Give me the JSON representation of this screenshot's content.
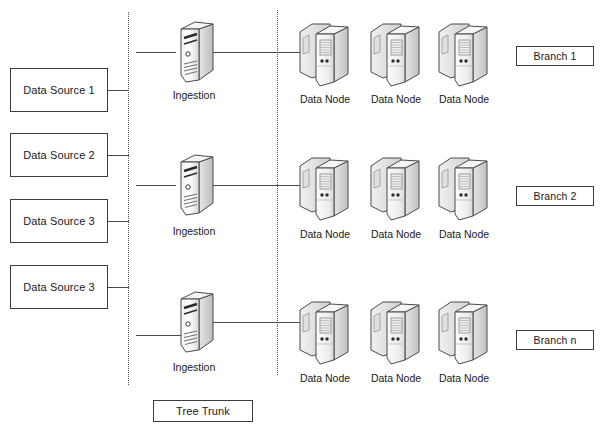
{
  "diagram": {
    "background_color": "#ffffff",
    "line_color": "#4a4a4a",
    "border_color": "#3c3c3c",
    "text_color": "#1a1a1a"
  },
  "data_sources": [
    {
      "label": "Data Source 1"
    },
    {
      "label": "Data Source 2"
    },
    {
      "label": "Data Source 3"
    },
    {
      "label": "Data Source 3"
    }
  ],
  "ingestion_nodes": [
    {
      "label": "Ingestion",
      "icon": "tower-server-icon"
    },
    {
      "label": "Ingestion",
      "icon": "tower-server-icon"
    },
    {
      "label": "Ingestion",
      "icon": "tower-server-icon"
    }
  ],
  "branches": [
    {
      "label": "Branch 1",
      "data_nodes": [
        {
          "label": "Data Node",
          "icon": "data-node-server-icon"
        },
        {
          "label": "Data Node",
          "icon": "data-node-server-icon"
        },
        {
          "label": "Data Node",
          "icon": "data-node-server-icon"
        }
      ]
    },
    {
      "label": "Branch 2",
      "data_nodes": [
        {
          "label": "Data Node",
          "icon": "data-node-server-icon"
        },
        {
          "label": "Data Node",
          "icon": "data-node-server-icon"
        },
        {
          "label": "Data Node",
          "icon": "data-node-server-icon"
        }
      ]
    },
    {
      "label": "Branch n",
      "data_nodes": [
        {
          "label": "Data Node",
          "icon": "data-node-server-icon"
        },
        {
          "label": "Data Node",
          "icon": "data-node-server-icon"
        },
        {
          "label": "Data Node",
          "icon": "data-node-server-icon"
        }
      ]
    }
  ],
  "trunk": {
    "label": "Tree Trunk"
  }
}
